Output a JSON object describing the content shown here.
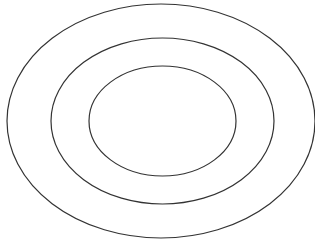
{
  "diagram": {
    "type": "concentric-ellipses",
    "background": "#ffffff",
    "stroke_color": "#333333",
    "stroke_width": 1.2,
    "ellipses": [
      {
        "name": "outer",
        "cx": 161,
        "cy": 121,
        "rx": 154,
        "ry": 117
      },
      {
        "name": "middle",
        "cx": 162.5,
        "cy": 121,
        "rx": 111.5,
        "ry": 83
      },
      {
        "name": "inner",
        "cx": 162.5,
        "cy": 121,
        "rx": 73.5,
        "ry": 55
      }
    ]
  }
}
